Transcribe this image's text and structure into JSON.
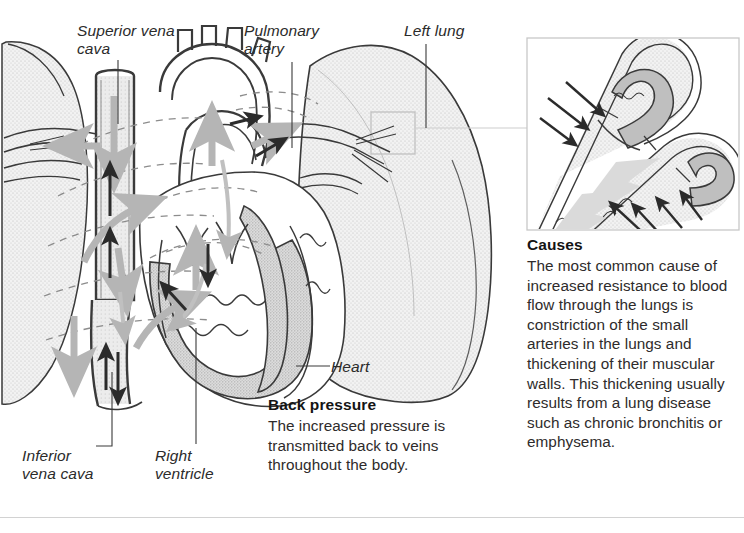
{
  "figure": {
    "type": "medical-anatomical-diagram",
    "labels": [
      {
        "id": "superior-vena-cava",
        "text": "Superior vena\ncava"
      },
      {
        "id": "pulmonary-artery",
        "text": "Pulmonary\nartery"
      },
      {
        "id": "left-lung",
        "text": "Left lung"
      },
      {
        "id": "heart",
        "text": "Heart"
      },
      {
        "id": "inferior-vena-cava",
        "text": "Inferior\nvena cava"
      },
      {
        "id": "right-ventricle",
        "text": "Right\nventricle"
      }
    ],
    "blocks": [
      {
        "id": "back-pressure",
        "title": "Back pressure",
        "body": "The increased pressure is\ntransmitted back to veins\nthroughout the body."
      },
      {
        "id": "causes",
        "title": "Causes",
        "body": "The most common cause of\nincreased resistance to blood\nflow through the lungs is\nconstriction of the small\narteries in the lungs and\nthickening of their muscular\nwalls. This thickening usually\nresults from a lung disease\nsuch as chronic bronchitis or\nemphysema."
      }
    ],
    "inset": {
      "id": "constricted-artery-detail",
      "caption": "Constricted small artery in the lung with thickened muscular wall"
    },
    "colors": {
      "outline": "#3a3a3a",
      "lung_fill": "#ededed",
      "muscle_fill": "#c9c9c9",
      "vessel_fill": "#e3e3e3",
      "flow_arrow": "#b5b5b5",
      "pressure_arrow": "#2b2b2b",
      "dashed_guide": "#8c8c8c",
      "rule": "#d2d2d2",
      "text": "#2b2b2b"
    }
  }
}
